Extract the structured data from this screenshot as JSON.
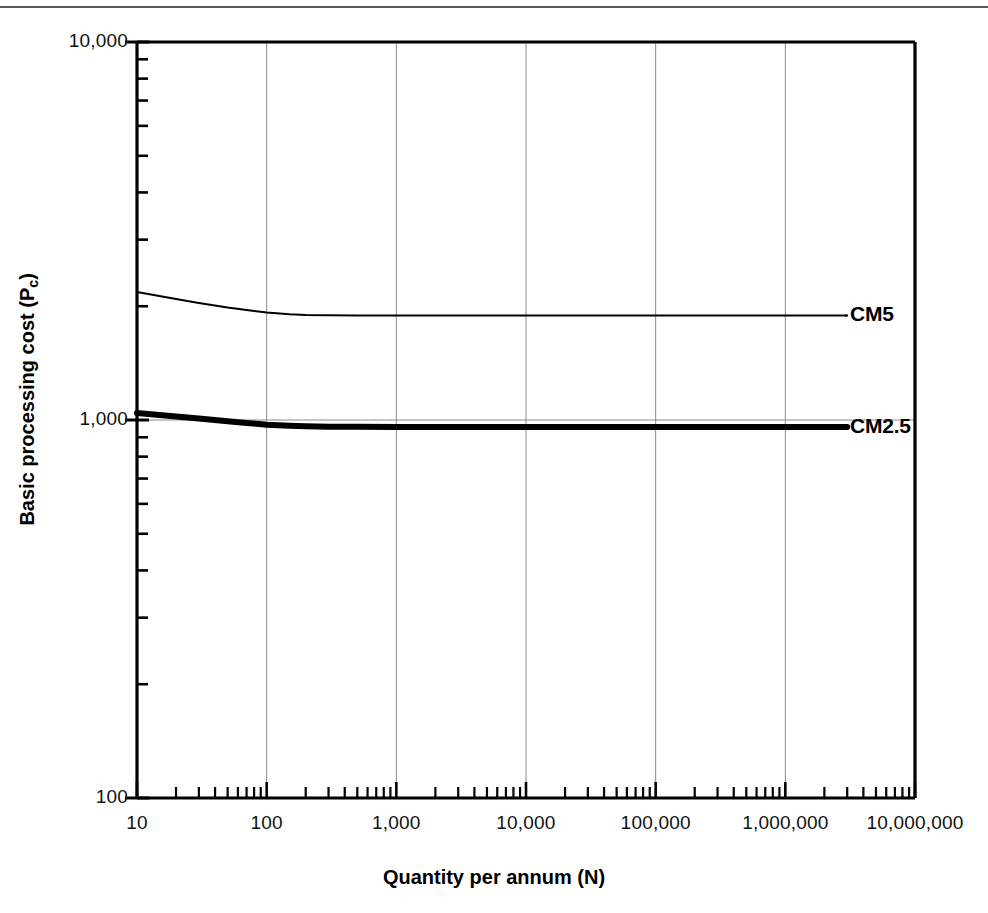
{
  "figure": {
    "background_color": "#ffffff",
    "ink_color": "#000000",
    "grid_color": "#8a8a8a",
    "has_scan_artifact_line": true
  },
  "chart_data": {
    "type": "line",
    "title": "",
    "subtitle": "",
    "xlabel": "Quantity per annum (N)",
    "ylabel": "Basic processing cost (Pc)",
    "ylabel_base": "Basic processing cost (P",
    "ylabel_sub": "c",
    "ylabel_tail": ")",
    "xscale": "log",
    "yscale": "log",
    "xlim": [
      10,
      10000000
    ],
    "ylim": [
      100,
      10000
    ],
    "grid": "major-xy",
    "legend": "inline-end-labels",
    "xticks": [
      10,
      100,
      1000,
      10000,
      100000,
      1000000,
      10000000
    ],
    "xtick_labels": [
      "10",
      "100",
      "1,000",
      "10,000",
      "100,000",
      "1,000,000",
      "10,000,000"
    ],
    "yticks": [
      100,
      1000,
      10000
    ],
    "ytick_labels": [
      "100",
      "1,000",
      "10,000"
    ],
    "minor_ticks": true,
    "series": [
      {
        "name": "CM5",
        "label": "CM5",
        "line_width": 2,
        "color": "#000000",
        "x": [
          10,
          20,
          30,
          50,
          70,
          100,
          150,
          200,
          300,
          500,
          1000,
          3000,
          10000,
          100000,
          1000000,
          3000000
        ],
        "values": [
          2180,
          2090,
          2040,
          1985,
          1955,
          1925,
          1905,
          1896,
          1892,
          1890,
          1890,
          1890,
          1890,
          1890,
          1890,
          1890
        ]
      },
      {
        "name": "CM2.5",
        "label": "CM2.5",
        "line_width": 6,
        "color": "#000000",
        "x": [
          10,
          20,
          30,
          50,
          70,
          100,
          150,
          200,
          300,
          500,
          1000,
          3000,
          10000,
          100000,
          1000000,
          3000000
        ],
        "values": [
          1043,
          1022,
          1009,
          993,
          982,
          972,
          965,
          962,
          960,
          959,
          958,
          958,
          958,
          958,
          958,
          958
        ]
      }
    ]
  }
}
